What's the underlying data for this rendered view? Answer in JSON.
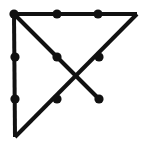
{
  "figure": {
    "canvas": {
      "width": 148,
      "height": 149,
      "background": "#ffffff"
    },
    "style": {
      "line_color": "#111111",
      "line_width": 4,
      "node_color": "#111111",
      "node_radius": 4.6
    },
    "points": {
      "corner_top_left": {
        "x": 14,
        "y": 14
      },
      "corner_top_right": {
        "x": 137,
        "y": 14
      },
      "corner_bottom_left": {
        "x": 15,
        "y": 137
      },
      "top_edge_mid_left": {
        "x": 57,
        "y": 14
      },
      "top_edge_mid_right": {
        "x": 98,
        "y": 14
      },
      "left_edge_upper": {
        "x": 15,
        "y": 57
      },
      "left_edge_lower": {
        "x": 15,
        "y": 99
      },
      "diag_main_upper": {
        "x": 57,
        "y": 57
      },
      "diag_anti_upper": {
        "x": 99,
        "y": 57
      },
      "diag_anti_lower": {
        "x": 57,
        "y": 99
      },
      "branch_endpoint": {
        "x": 99,
        "y": 99
      },
      "crossing_center": {
        "x": 78,
        "y": 78
      }
    },
    "edges": [
      {
        "name": "top-edge",
        "from": "corner_top_left",
        "to": "corner_top_right"
      },
      {
        "name": "left-edge",
        "from": "corner_top_left",
        "to": "corner_bottom_left"
      },
      {
        "name": "main-diagonal",
        "from": "corner_top_left",
        "to": "branch_endpoint"
      },
      {
        "name": "anti-diagonal",
        "from": "corner_top_right",
        "to": "corner_bottom_left"
      }
    ],
    "vertices": [
      "corner_top_left",
      "top_edge_mid_left",
      "top_edge_mid_right",
      "left_edge_upper",
      "left_edge_lower",
      "diag_main_upper",
      "diag_anti_upper",
      "diag_anti_lower",
      "branch_endpoint"
    ]
  }
}
